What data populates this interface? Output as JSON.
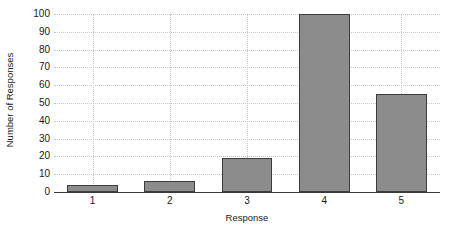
{
  "chart_data": {
    "type": "bar",
    "title": "",
    "categories": [
      "1",
      "2",
      "3",
      "4",
      "5"
    ],
    "values": [
      4,
      6,
      19,
      100,
      55
    ],
    "series": [
      {
        "name": "Number of Responses",
        "values": [
          4,
          6,
          19,
          100,
          55
        ]
      }
    ],
    "xlabel": "Response",
    "ylabel": "Number of Responses",
    "xtick_labels": [
      "1",
      "2",
      "3",
      "4",
      "5"
    ],
    "ytick_labels": [
      "0",
      "10",
      "20",
      "30",
      "40",
      "50",
      "60",
      "70",
      "80",
      "90",
      "100"
    ],
    "ytick_values": [
      0,
      10,
      20,
      30,
      40,
      50,
      60,
      70,
      80,
      90,
      100
    ],
    "ylim": [
      0,
      100
    ],
    "xlim": [
      0.5,
      5.5
    ],
    "grid": true,
    "grid_axis": "both",
    "grid_style": "dotted",
    "legend": false,
    "legend_position": "none",
    "bar_fill_color": "#8c8c8c",
    "bar_edge_color": "#3d3d3d",
    "grid_color": "#c8c8c8",
    "axis_color": "#3a3a3a",
    "text_color": "#1a1a1a",
    "background_color": "#ffffff"
  }
}
